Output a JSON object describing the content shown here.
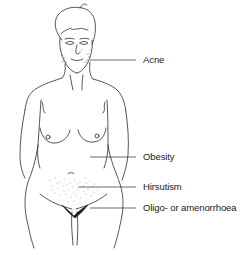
{
  "diagram": {
    "labels": [
      {
        "id": "acne",
        "text": "Acne",
        "x": 143,
        "y": 55,
        "line_from_x": 90,
        "line_to_x": 136,
        "line_y": 60
      },
      {
        "id": "obesity",
        "text": "Obesity",
        "x": 143,
        "y": 152,
        "line_from_x": 90,
        "line_to_x": 136,
        "line_y": 157
      },
      {
        "id": "hirsutism",
        "text": "Hirsutism",
        "x": 143,
        "y": 182,
        "line_from_x": 78,
        "line_to_x": 136,
        "line_y": 187
      },
      {
        "id": "oligo",
        "text": "Oligo- or amenorrhoea",
        "x": 143,
        "y": 203,
        "line_from_x": 90,
        "line_to_x": 136,
        "line_y": 208
      }
    ],
    "colors": {
      "line": "#2b2b2b",
      "text": "#1a1a1a",
      "stipple": "#9a9a9a",
      "background": "#ffffff"
    }
  }
}
